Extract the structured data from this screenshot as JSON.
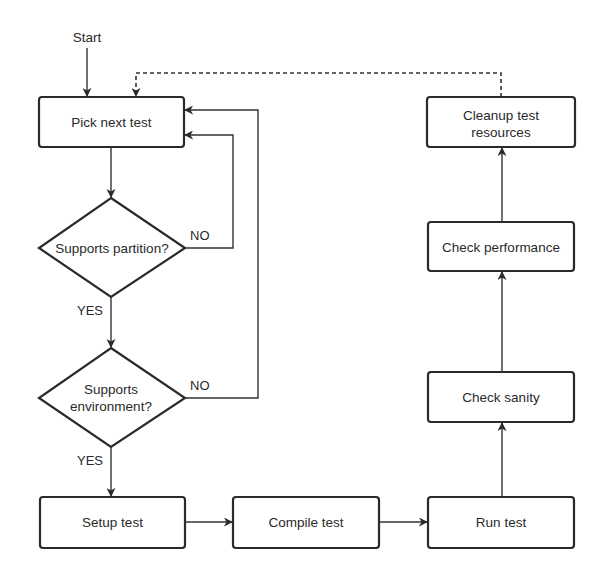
{
  "diagram": {
    "start_label": "Start",
    "nodes": {
      "pick_next_test": "Pick next test",
      "supports_partition": "Supports partition?",
      "supports_environment_line1": "Supports",
      "supports_environment_line2": "environment?",
      "setup_test": "Setup test",
      "compile_test": "Compile test",
      "run_test": "Run test",
      "check_sanity": "Check sanity",
      "check_performance": "Check performance",
      "cleanup_line1": "Cleanup test",
      "cleanup_line2": "resources"
    },
    "branches": {
      "partition_no": "NO",
      "partition_yes": "YES",
      "environment_no": "NO",
      "environment_yes": "YES"
    }
  }
}
